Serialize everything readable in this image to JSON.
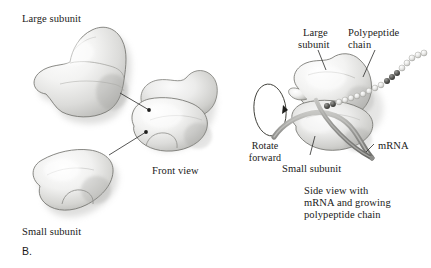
{
  "figure": {
    "panel_letter": "B.",
    "title_absent": true
  },
  "labels": {
    "large_subunit_left": "Large subunit",
    "small_subunit_left": "Small subunit",
    "front_view": "Front view",
    "rotate_forward_line1": "Rotate",
    "rotate_forward_line2": "forward",
    "large_subunit_right_line1": "Large",
    "large_subunit_right_line2": "subunit",
    "polypeptide_chain_line1": "Polypeptide",
    "polypeptide_chain_line2": "chain",
    "small_subunit_right": "Small subunit",
    "mrna": "mRNA",
    "side_view_line1": "Side view with",
    "side_view_line2": "mRNA and growing",
    "side_view_line3": "polypeptide chain"
  },
  "colors": {
    "text": "#1a1a18",
    "outline": "#6f6f6c",
    "body_light": "#f4f4f3",
    "body_mid": "#d8d8d6",
    "body_shadow": "#b9b9b6",
    "leader_line": "#2b2b29",
    "mrna_strand": "#8a8a87",
    "bead_light": "#e9e9e7",
    "bead_dark": "#4a4a47",
    "background": "#ffffff"
  },
  "diagram": {
    "type": "biological-schematic",
    "parts": [
      {
        "name": "large-subunit-separate",
        "view": "separated",
        "side": "left-top"
      },
      {
        "name": "small-subunit-separate",
        "view": "separated",
        "side": "left-bottom"
      },
      {
        "name": "assembled-ribosome-front",
        "view": "front",
        "side": "center"
      },
      {
        "name": "rotation-indicator",
        "view": "ellipse-arrow",
        "side": "center-right"
      },
      {
        "name": "assembled-ribosome-side",
        "view": "side",
        "side": "right"
      },
      {
        "name": "polypeptide-chain",
        "render": "bead-string",
        "side": "right-top"
      },
      {
        "name": "mrna-strand",
        "render": "ribbon",
        "side": "right-bottom"
      }
    ]
  }
}
